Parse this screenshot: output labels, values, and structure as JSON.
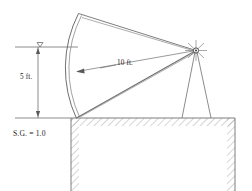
{
  "figure": {
    "background_color": "#ffffff",
    "line_color": "#6f6f6f",
    "dark_line_color": "#4a4a4a",
    "text_color": "#1a1a1a",
    "width": 252,
    "height": 191
  },
  "labels": {
    "depth": "5 ft.",
    "radius": "10 ft.",
    "specific_gravity": "S.G. = 1.0"
  },
  "icons": {
    "water_surface": "water-surface-triangle-icon",
    "pivot": "pivot-hub-icon",
    "radius_arrow": "radius-arrowhead-icon",
    "depth_arrow_up": "depth-arrow-up-icon",
    "depth_arrow_down": "depth-arrow-down-icon"
  },
  "geometry": {
    "pivot": {
      "x": 196,
      "y": 50.5
    },
    "radius_px": 120,
    "gate": {
      "top": {
        "x": 78,
        "y": 14
      },
      "bottom": {
        "x": 76,
        "y": 118
      },
      "mid": {
        "x": 70,
        "y": 66
      },
      "thickness_px": 3
    },
    "water_surface_y": 47,
    "ground_y": 118,
    "datum_y": 118,
    "wall": {
      "left_face_x": 71,
      "right_face_x": 235,
      "hatch_band_px": 8
    },
    "support_legs": {
      "left_foot": {
        "x": 182,
        "y": 118
      },
      "right_foot": {
        "x": 211,
        "y": 118
      }
    },
    "dimension_line_x": 38,
    "water_line": {
      "x1": 15,
      "x2": 78,
      "y": 47
    }
  },
  "annotations": {
    "depth_dimension": {
      "from_y": 47,
      "to_y": 118,
      "value": "5 ft.",
      "meaning": "water depth above gate seat"
    },
    "radius_dimension": {
      "from": "pivot",
      "to": "gate face",
      "value": "10 ft.",
      "meaning": "gate radius of curvature"
    },
    "fluid": {
      "value": "S.G. = 1.0",
      "meaning": "water, specific gravity 1.0"
    }
  }
}
